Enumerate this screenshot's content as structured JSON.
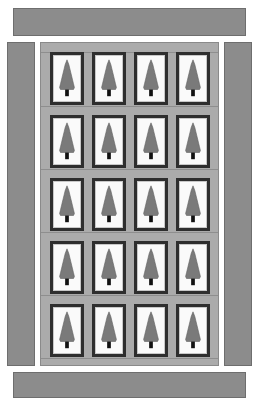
{
  "colors": {
    "border_strip": "#8c8c8c",
    "lattice": "#ababab",
    "tile_frame": "#2e2e2e",
    "tile_background": "#fafafa",
    "tree": "#7a7a7a",
    "trunk": "#111111"
  },
  "layout": {
    "strips": [
      {
        "name": "top-border-strip",
        "x": 13,
        "y": 8,
        "w": 233,
        "h": 28
      },
      {
        "name": "left-border-strip",
        "x": 7,
        "y": 42,
        "w": 28,
        "h": 324
      },
      {
        "name": "right-border-strip",
        "x": 224,
        "y": 42,
        "w": 28,
        "h": 324
      },
      {
        "name": "bottom-border-strip",
        "x": 13,
        "y": 372,
        "w": 233,
        "h": 26
      }
    ],
    "grid": {
      "rows": 5,
      "cols": 4,
      "tile_w": 34,
      "tile_h": 53,
      "x0": 10,
      "y0": 10,
      "dx": 42,
      "dy": 63
    },
    "block_icon": "pine-tree-icon"
  }
}
